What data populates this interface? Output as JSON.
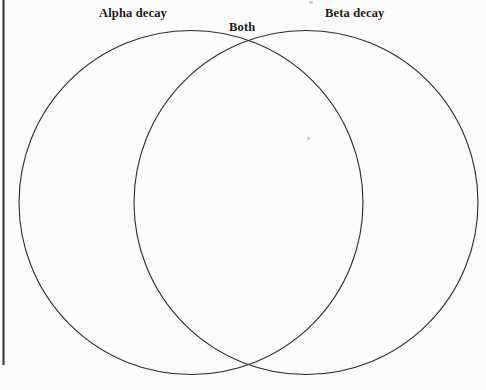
{
  "canvas": {
    "width": 486,
    "height": 390,
    "background_color": "#fcfcfc"
  },
  "diagram": {
    "type": "venn",
    "set_count": 2,
    "stroke_color": "#2b2b2b",
    "stroke_width": 1.1,
    "fill": "none",
    "left_circle": {
      "cx": 191,
      "cy": 202.5,
      "r": 172
    },
    "right_circle": {
      "cx": 306,
      "cy": 202.5,
      "r": 172
    },
    "intersection_points": [
      {
        "x": 248.5,
        "y": 42
      },
      {
        "x": 248.5,
        "y": 363
      }
    ],
    "border_rule": {
      "orientation": "vertical",
      "x": 3.5,
      "y_start": 0,
      "y_end": 365,
      "color": "#2f2f2f",
      "width": 2
    }
  },
  "labels": {
    "left_set": "Alpha decay",
    "intersection": "Both",
    "right_set": "Beta decay"
  },
  "regions": {
    "left_only_content": "",
    "overlap_content": "",
    "right_only_content": ""
  },
  "artifacts": {
    "center_speck_color": "#c9c9c9",
    "top_speck_color": "#d4d4d4"
  }
}
